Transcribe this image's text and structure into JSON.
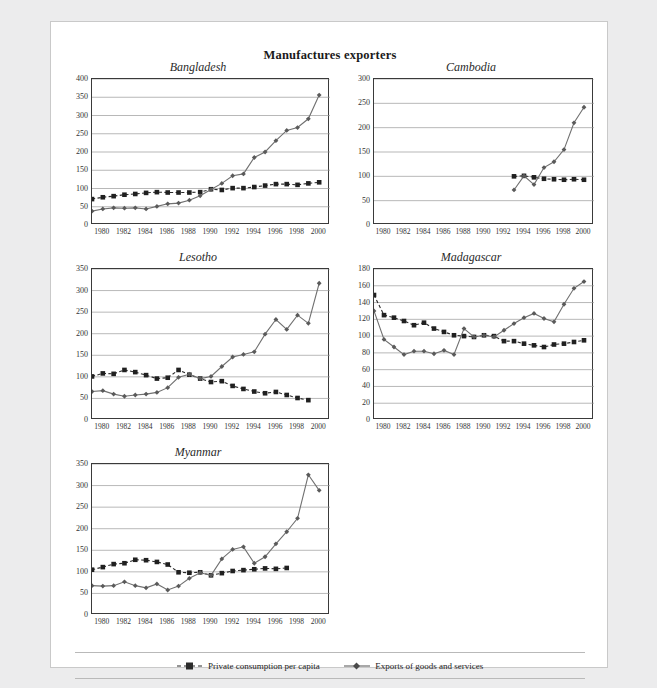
{
  "page": {
    "title": "Manufactures exporters",
    "background_color": "#ececed",
    "panel_color": "#ffffff"
  },
  "legend": {
    "items": [
      {
        "label": "Private consumption per capita",
        "marker": "square-marker",
        "line": "dashed",
        "color": "#2b2b2b"
      },
      {
        "label": "Exports of goods and services",
        "marker": "diamond-marker",
        "line": "solid",
        "color": "#6e6e6e"
      }
    ]
  },
  "axis": {
    "x_tick_labels": [
      "1980",
      "1982",
      "1984",
      "1986",
      "1988",
      "1990",
      "1992",
      "1994",
      "1996",
      "1998",
      "2000"
    ],
    "x_min": 1979,
    "x_max": 2001
  },
  "chart_data": [
    {
      "type": "line",
      "title": "Bangladesh",
      "xlabel": "",
      "ylabel": "",
      "ylim": [
        0,
        400
      ],
      "ytick_step": 50,
      "ytick_labels": [
        "0",
        "50",
        "100",
        "150",
        "200",
        "250",
        "300",
        "350",
        "400"
      ],
      "xlim": [
        1979,
        2001
      ],
      "grid": true,
      "x": [
        1979,
        1980,
        1981,
        1982,
        1983,
        1984,
        1985,
        1986,
        1987,
        1988,
        1989,
        1990,
        1991,
        1992,
        1993,
        1994,
        1995,
        1996,
        1997,
        1998,
        1999,
        2000
      ],
      "series": [
        {
          "name": "Private consumption per capita",
          "marker": "square",
          "line": "dashed",
          "values": [
            71,
            76,
            79,
            83,
            85,
            88,
            90,
            89,
            89,
            89,
            90,
            98,
            96,
            101,
            101,
            104,
            108,
            112,
            112,
            110,
            114,
            117
          ]
        },
        {
          "name": "Exports of goods and services",
          "marker": "diamond",
          "line": "solid",
          "values": [
            38,
            44,
            47,
            46,
            47,
            44,
            51,
            58,
            60,
            68,
            80,
            97,
            114,
            135,
            140,
            185,
            200,
            231,
            259,
            267,
            291,
            356
          ]
        }
      ]
    },
    {
      "type": "line",
      "title": "Cambodia",
      "xlabel": "",
      "ylabel": "",
      "ylim": [
        0,
        300
      ],
      "ytick_step": 50,
      "ytick_labels": [
        "0",
        "50",
        "100",
        "150",
        "200",
        "250",
        "300"
      ],
      "xlim": [
        1979,
        2001
      ],
      "grid": true,
      "x": [
        1993,
        1994,
        1995,
        1996,
        1997,
        1998,
        1999,
        2000
      ],
      "series": [
        {
          "name": "Private consumption per capita",
          "marker": "square",
          "line": "dashed",
          "values": [
            100,
            101,
            98,
            95,
            94,
            93,
            94,
            93
          ]
        },
        {
          "name": "Exports of goods and services",
          "marker": "diamond",
          "line": "solid",
          "values": [
            72,
            101,
            83,
            118,
            130,
            155,
            210,
            242
          ]
        }
      ]
    },
    {
      "type": "line",
      "title": "Lesotho",
      "xlabel": "",
      "ylabel": "",
      "ylim": [
        0,
        350
      ],
      "ytick_step": 50,
      "ytick_labels": [
        "0",
        "50",
        "100",
        "150",
        "200",
        "250",
        "300",
        "350"
      ],
      "xlim": [
        1979,
        2001
      ],
      "grid": true,
      "x": [
        1979,
        1980,
        1981,
        1982,
        1983,
        1984,
        1985,
        1986,
        1987,
        1988,
        1989,
        1990,
        1991,
        1992,
        1993,
        1994,
        1995,
        1996,
        1997,
        1998,
        1999,
        2000
      ],
      "series": [
        {
          "name": "Private consumption per capita",
          "marker": "square",
          "line": "dashed",
          "values": [
            101,
            108,
            107,
            116,
            111,
            104,
            96,
            98,
            116,
            105,
            96,
            88,
            90,
            79,
            72,
            66,
            62,
            65,
            58,
            51,
            46,
            null
          ]
        },
        {
          "name": "Exports of goods and services",
          "marker": "diamond",
          "line": "solid",
          "values": [
            66,
            68,
            60,
            55,
            58,
            60,
            64,
            75,
            99,
            106,
            96,
            101,
            124,
            146,
            152,
            158,
            199,
            233,
            210,
            243,
            224,
            317
          ]
        }
      ]
    },
    {
      "type": "line",
      "title": "Madagascar",
      "xlabel": "",
      "ylabel": "",
      "ylim": [
        0,
        180
      ],
      "ytick_step": 20,
      "ytick_labels": [
        "0",
        "20",
        "40",
        "60",
        "80",
        "100",
        "120",
        "140",
        "160",
        "180"
      ],
      "xlim": [
        1979,
        2001
      ],
      "grid": true,
      "x": [
        1979,
        1980,
        1981,
        1982,
        1983,
        1984,
        1985,
        1986,
        1987,
        1988,
        1989,
        1990,
        1991,
        1992,
        1993,
        1994,
        1995,
        1996,
        1997,
        1998,
        1999,
        2000
      ],
      "series": [
        {
          "name": "Private consumption per capita",
          "marker": "square",
          "line": "dashed",
          "values": [
            149,
            125,
            122,
            118,
            113,
            116,
            109,
            105,
            101,
            100,
            99,
            101,
            100,
            94,
            94,
            91,
            89,
            87,
            90,
            91,
            93,
            95
          ]
        },
        {
          "name": "Exports of goods and services",
          "marker": "diamond",
          "line": "solid",
          "values": [
            130,
            96,
            87,
            78,
            82,
            82,
            79,
            83,
            78,
            109,
            99,
            101,
            99,
            107,
            115,
            122,
            127,
            121,
            117,
            138,
            157,
            165
          ]
        }
      ]
    },
    {
      "type": "line",
      "title": "Myanmar",
      "xlabel": "",
      "ylabel": "",
      "ylim": [
        0,
        350
      ],
      "ytick_step": 50,
      "ytick_labels": [
        "0",
        "50",
        "100",
        "150",
        "200",
        "250",
        "300",
        "350"
      ],
      "xlim": [
        1979,
        2001
      ],
      "grid": true,
      "x": [
        1979,
        1980,
        1981,
        1982,
        1983,
        1984,
        1985,
        1986,
        1987,
        1988,
        1989,
        1990,
        1991,
        1992,
        1993,
        1994,
        1995,
        1996,
        1997,
        1998,
        1999,
        2000
      ],
      "series": [
        {
          "name": "Private consumption per capita",
          "marker": "square",
          "line": "dashed",
          "values": [
            105,
            111,
            118,
            120,
            128,
            127,
            123,
            117,
            99,
            98,
            99,
            92,
            97,
            102,
            104,
            106,
            108,
            107,
            109,
            null,
            null,
            null
          ]
        },
        {
          "name": "Exports of goods and services",
          "marker": "diamond",
          "line": "solid",
          "values": [
            68,
            67,
            68,
            77,
            68,
            63,
            72,
            58,
            67,
            85,
            98,
            92,
            130,
            152,
            158,
            120,
            135,
            165,
            193,
            224,
            325,
            289
          ]
        }
      ]
    }
  ]
}
